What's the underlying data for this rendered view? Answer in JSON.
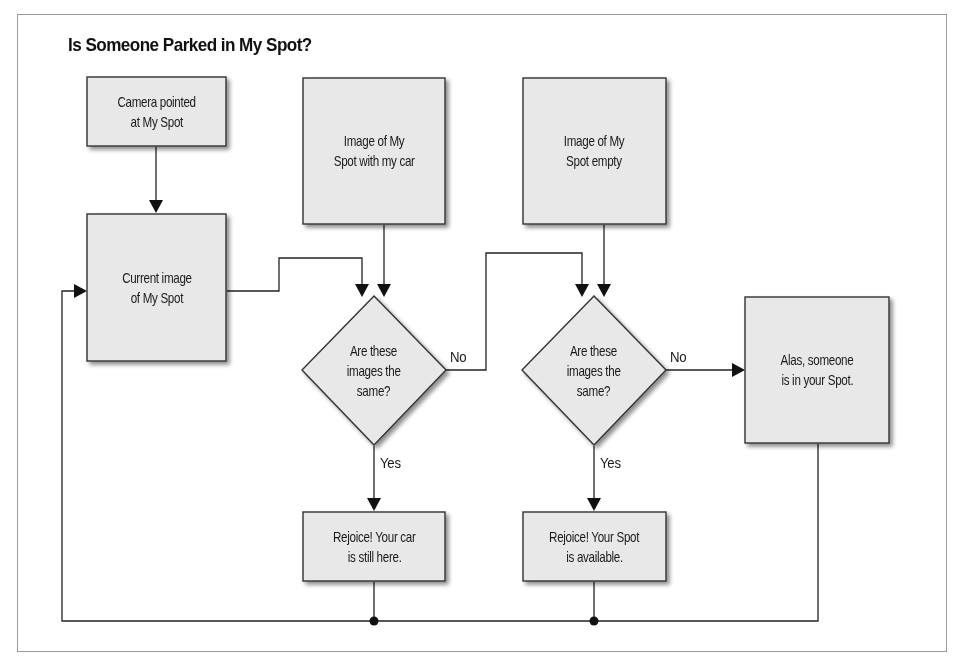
{
  "title": "Is Someone Parked in My Spot?",
  "colors": {
    "node_fill": "#e8e8e8",
    "node_stroke": "#333333",
    "line": "#222222",
    "frame": "#9a9a9a"
  },
  "nodes": {
    "camera": {
      "type": "process",
      "label_line1": "Camera pointed",
      "label_line2": "at My Spot"
    },
    "current_image": {
      "type": "process",
      "label_line1": "Current image",
      "label_line2": "of My Spot"
    },
    "image_with_car": {
      "type": "process",
      "label_line1": "Image of My",
      "label_line2": "Spot with my car"
    },
    "image_empty": {
      "type": "process",
      "label_line1": "Image of My",
      "label_line2": "Spot empty"
    },
    "decision_1": {
      "type": "decision",
      "label_line1": "Are these",
      "label_line2": "images the",
      "label_line3": "same?"
    },
    "decision_2": {
      "type": "decision",
      "label_line1": "Are these",
      "label_line2": "images the",
      "label_line3": "same?"
    },
    "alas": {
      "type": "process",
      "label_line1": "Alas, someone",
      "label_line2": "is in your Spot."
    },
    "rejoice_car": {
      "type": "process",
      "label_line1": "Rejoice! Your car",
      "label_line2": "is still here."
    },
    "rejoice_spot": {
      "type": "process",
      "label_line1": "Rejoice! Your Spot",
      "label_line2": "is available."
    }
  },
  "edges": {
    "decision_1_no": "No",
    "decision_1_yes": "Yes",
    "decision_2_no": "No",
    "decision_2_yes": "Yes"
  },
  "edge_list": [
    {
      "from": "camera",
      "to": "current_image"
    },
    {
      "from": "current_image",
      "to": "decision_1"
    },
    {
      "from": "image_with_car",
      "to": "decision_1"
    },
    {
      "from": "decision_1",
      "to": "decision_2",
      "label": "No"
    },
    {
      "from": "image_empty",
      "to": "decision_2"
    },
    {
      "from": "decision_1",
      "to": "rejoice_car",
      "label": "Yes"
    },
    {
      "from": "decision_2",
      "to": "alas",
      "label": "No"
    },
    {
      "from": "decision_2",
      "to": "rejoice_spot",
      "label": "Yes"
    },
    {
      "from": "rejoice_car",
      "to": "current_image",
      "note": "loop back"
    },
    {
      "from": "rejoice_spot",
      "to": "current_image",
      "note": "loop back"
    },
    {
      "from": "alas",
      "to": "current_image",
      "note": "loop back"
    }
  ]
}
